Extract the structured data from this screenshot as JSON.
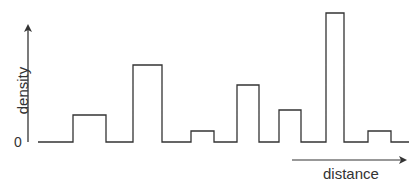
{
  "chart_data": {
    "type": "bar",
    "title": "",
    "xlabel": "distance",
    "ylabel": "density",
    "y_tick_labels": [
      "0"
    ],
    "style": "step histogram outline (no fill), separated by zero-density gaps",
    "grid": false,
    "legend": null,
    "axes": {
      "y_axis_arrow": true,
      "x_axis_arrow_below_plot": true
    },
    "note": "No numeric scale shown; values are relative heights (tallest = 1.0)",
    "categories": [
      "peak 1",
      "peak 2",
      "peak 3",
      "peak 4",
      "peak 5",
      "peak 6",
      "peak 7"
    ],
    "values": [
      0.22,
      0.6,
      0.09,
      0.44,
      0.25,
      1.0,
      0.09
    ],
    "bars_px": [
      {
        "x0": 73,
        "x1": 106,
        "top": 115
      },
      {
        "x0": 133,
        "x1": 162,
        "top": 65
      },
      {
        "x0": 191,
        "x1": 214,
        "top": 131
      },
      {
        "x0": 237,
        "x1": 259,
        "top": 85
      },
      {
        "x0": 279,
        "x1": 301,
        "top": 110
      },
      {
        "x0": 326,
        "x1": 344,
        "top": 13
      },
      {
        "x0": 368,
        "x1": 391,
        "top": 131
      }
    ],
    "baseline_px": {
      "y": 142,
      "x_start": 38,
      "x_end": 409
    }
  },
  "labels": {
    "ylabel": "density",
    "zero": "0",
    "xlabel": "distance"
  },
  "colors": {
    "line": "#333333",
    "background": "#ffffff"
  }
}
